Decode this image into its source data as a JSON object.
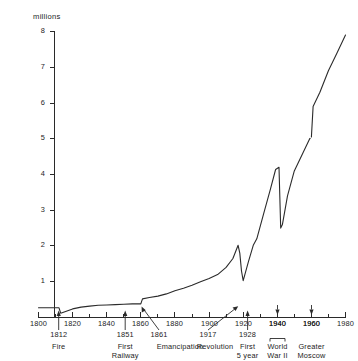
{
  "chart_data": {
    "type": "line",
    "title": "",
    "ylabel": "millions",
    "xlabel": "",
    "ylim": [
      0,
      8
    ],
    "xlim": [
      1800,
      1980
    ],
    "grid": false,
    "legend": "none",
    "y_ticks": [
      "8",
      "7",
      "6",
      "5",
      "4",
      "3",
      "2",
      "1"
    ],
    "y_tick_values": [
      8,
      7,
      6,
      5,
      4,
      3,
      2,
      1
    ],
    "x_ticks": [
      "1800",
      "1820",
      "1840",
      "1860",
      "1880",
      "1900",
      "1920",
      "1940",
      "1960",
      "1980"
    ],
    "x_tick_values": [
      1800,
      1820,
      1840,
      1860,
      1880,
      1900,
      1920,
      1940,
      1960,
      1980
    ],
    "x_minor_ticks": [
      1810,
      1830,
      1850,
      1870,
      1890,
      1910,
      1930,
      1950,
      1970
    ],
    "series": [
      {
        "name": "Moscow population",
        "x": [
          1800,
          1811,
          1812,
          1813,
          1820,
          1825,
          1830,
          1835,
          1840,
          1845,
          1850,
          1855,
          1860,
          1861,
          1865,
          1870,
          1875,
          1880,
          1885,
          1890,
          1895,
          1900,
          1905,
          1910,
          1914,
          1917,
          1918,
          1919,
          1920,
          1923,
          1926,
          1928,
          1932,
          1936,
          1939,
          1941,
          1942,
          1943,
          1946,
          1950,
          1955,
          1959,
          1960,
          1961,
          1965,
          1970,
          1975,
          1980
        ],
        "values": [
          0.27,
          0.27,
          0.27,
          0.12,
          0.24,
          0.29,
          0.32,
          0.34,
          0.35,
          0.36,
          0.37,
          0.38,
          0.38,
          0.52,
          0.56,
          0.6,
          0.66,
          0.75,
          0.82,
          0.9,
          1.0,
          1.09,
          1.2,
          1.4,
          1.65,
          2.02,
          1.8,
          1.3,
          1.03,
          1.55,
          2.03,
          2.2,
          2.9,
          3.6,
          4.14,
          4.2,
          2.5,
          2.6,
          3.4,
          4.1,
          4.6,
          5.0,
          5.05,
          5.9,
          6.3,
          6.9,
          7.4,
          7.9
        ]
      }
    ],
    "annotations": [
      {
        "year": "1812",
        "label": "Fire",
        "x_value": 1812
      },
      {
        "year": "1851",
        "label": "First Railway",
        "x_value": 1851
      },
      {
        "year": "1861",
        "label": "Emancipation",
        "x_value": 1861
      },
      {
        "year": "1917",
        "label": "Revolution",
        "x_value": 1917
      },
      {
        "year": "1928",
        "label": "First 5 year",
        "x_value": 1928
      },
      {
        "year": "1940",
        "label": "World War II",
        "x_value": 1940
      },
      {
        "year": "1960",
        "label": "Greater Moscow",
        "x_value": 1960
      }
    ],
    "note": "dotted segment near 1960 marks boundary change (Greater Moscow)"
  },
  "labels": {
    "axis_title": "millions",
    "y": [
      "8",
      "7",
      "6",
      "5",
      "4",
      "3",
      "2",
      "1"
    ],
    "x": [
      "1800",
      "1820",
      "1840",
      "1860",
      "1880",
      "1900",
      "1920",
      "1940",
      "1960",
      "1980"
    ],
    "anno": {
      "fire_year": "1812",
      "fire_text": "Fire",
      "rail_year": "1851",
      "rail_text_1": "First",
      "rail_text_2": "Railway",
      "emanc_year": "1861",
      "emanc_text": "Emancipation",
      "revo_year": "1917",
      "revo_text": "Revolution",
      "five_year": "1928",
      "five_text_1": "First",
      "five_text_2": "5 year",
      "ww2_year": "1940",
      "ww2_text_1": "World",
      "ww2_text_2": "War II",
      "moscow_year": "1960",
      "moscow_text_1": "Greater",
      "moscow_text_2": "Moscow"
    }
  },
  "colors": {
    "line": "#2b2b2b",
    "axis": "#2a2a2a",
    "background": "#ffffff"
  }
}
